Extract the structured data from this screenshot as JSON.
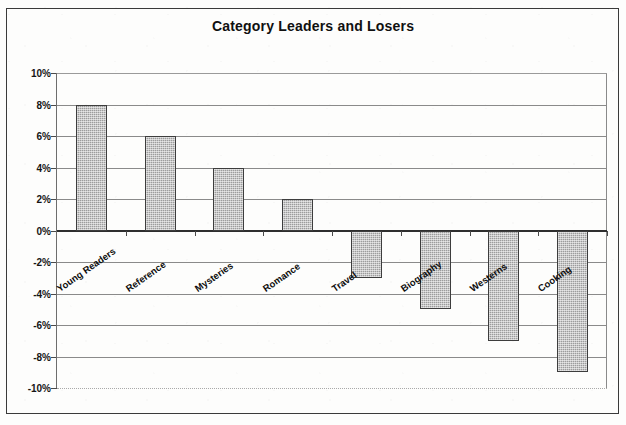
{
  "chart_data": {
    "type": "bar",
    "title": "Category Leaders and Losers",
    "xlabel": "",
    "ylabel": "",
    "categories": [
      "Young Readers",
      "Reference",
      "Mysteries",
      "Romance",
      "Travel",
      "Biography",
      "Westerns",
      "Cooking"
    ],
    "values": [
      8,
      6,
      4,
      2,
      -3,
      -5,
      -7,
      -9
    ],
    "value_suffix": "%",
    "ylim": [
      -10,
      10
    ],
    "ytick_step": 2,
    "ytick_labels": [
      "10%",
      "8%",
      "6%",
      "4%",
      "2%",
      "0%",
      "-2%",
      "-4%",
      "-6%",
      "-8%",
      "-10%"
    ],
    "ytick_values": [
      10,
      8,
      6,
      4,
      2,
      0,
      -2,
      -4,
      -6,
      -8,
      -10
    ],
    "grid": true,
    "legend": false,
    "legend_position": "none",
    "bar_color": "#9c9c9c",
    "bar_border_color": "#3d3d3d",
    "gridline_color": "#8a8a8a",
    "zero_line_color": "#2e2e2e",
    "title_color": "#101010",
    "plot_background": "#ffffff",
    "label_rotation_deg": -35
  }
}
